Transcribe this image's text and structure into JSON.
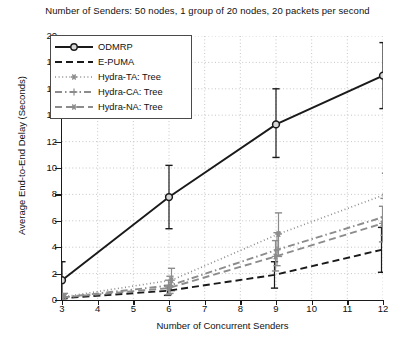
{
  "chart_data": {
    "type": "line",
    "title": "Number of Senders: 50 nodes, 1 group of 20 nodes, 20 packets per second",
    "xlabel": "Number of Concurrent Senders",
    "ylabel": "Average End-to-End Delay (Seconds)",
    "x": [
      3,
      6,
      9,
      12
    ],
    "xlim": [
      3,
      12
    ],
    "ylim": [
      0,
      20
    ],
    "xticks": [
      3,
      4,
      5,
      6,
      7,
      8,
      9,
      10,
      11,
      12
    ],
    "yticks": [
      0,
      2,
      4,
      6,
      8,
      10,
      12,
      14,
      16,
      18,
      20
    ],
    "grid": true,
    "legend_position": "upper left",
    "series": [
      {
        "name": "ODMRP",
        "style": "solid",
        "marker": "circle",
        "color": "#1a1a1a",
        "values": [
          1.5,
          7.8,
          13.3,
          17.0
        ],
        "err_low": [
          0.2,
          5.4,
          10.8,
          14.5
        ],
        "err_high": [
          2.9,
          10.2,
          16.0,
          19.5
        ]
      },
      {
        "name": "E-PUMA",
        "style": "dashed",
        "marker": "none",
        "color": "#1a1a1a",
        "values": [
          0.12,
          0.7,
          1.9,
          3.8
        ],
        "err_low": [
          0.05,
          0.35,
          0.9,
          2.1
        ],
        "err_high": [
          0.25,
          1.1,
          2.9,
          5.5
        ]
      },
      {
        "name": "Hydra-TA: Tree",
        "style": "dotted",
        "marker": "star",
        "color": "#8c8c8c",
        "values": [
          0.25,
          1.5,
          5.0,
          8.0
        ],
        "err_low": [
          0.1,
          0.7,
          3.3,
          6.2
        ],
        "err_high": [
          0.5,
          2.4,
          6.6,
          9.6
        ]
      },
      {
        "name": "Hydra-CA: Tree",
        "style": "dashdot",
        "marker": "plus",
        "color": "#8c8c8c",
        "values": [
          0.2,
          1.1,
          3.8,
          6.3
        ],
        "err_low": [
          0.08,
          0.5,
          2.6,
          4.9
        ],
        "err_high": [
          0.4,
          1.8,
          5.1,
          7.7
        ]
      },
      {
        "name": "Hydra-NA: Tree",
        "style": "dashed",
        "marker": "star",
        "color": "#8c8c8c",
        "values": [
          0.18,
          0.9,
          3.3,
          5.8
        ],
        "err_low": [
          0.07,
          0.4,
          2.2,
          4.4
        ],
        "err_high": [
          0.35,
          1.5,
          4.5,
          7.1
        ]
      }
    ]
  },
  "legend": {
    "items": [
      {
        "label": "ODMRP"
      },
      {
        "label": "E-PUMA"
      },
      {
        "label": "Hydra-TA: Tree"
      },
      {
        "label": "Hydra-CA: Tree"
      },
      {
        "label": "Hydra-NA: Tree"
      }
    ]
  }
}
